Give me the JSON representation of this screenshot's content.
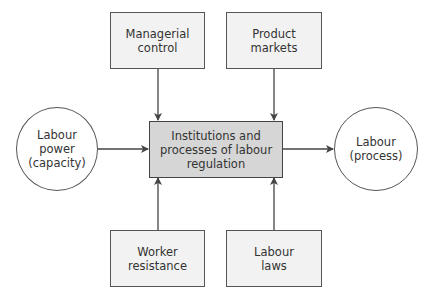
{
  "diagram": {
    "nodes": {
      "managerial_control": {
        "label": "Managerial\ncontrol",
        "shape": "box"
      },
      "product_markets": {
        "label": "Product\nmarkets",
        "shape": "box"
      },
      "central": {
        "label": "Institutions and\nprocesses of labour\nregulation",
        "shape": "box"
      },
      "labour_power": {
        "label": "Labour\npower\n(capacity)",
        "shape": "circle"
      },
      "labour_process": {
        "label": "Labour\n(process)",
        "shape": "circle"
      },
      "worker_resistance": {
        "label": "Worker\nresistance",
        "shape": "box"
      },
      "labour_laws": {
        "label": "Labour\nlaws",
        "shape": "box"
      }
    },
    "edges": [
      {
        "from": "managerial_control",
        "to": "central"
      },
      {
        "from": "product_markets",
        "to": "central"
      },
      {
        "from": "worker_resistance",
        "to": "central"
      },
      {
        "from": "labour_laws",
        "to": "central"
      },
      {
        "from": "labour_power",
        "to": "central"
      },
      {
        "from": "central",
        "to": "labour_process"
      }
    ],
    "colors": {
      "box_fill": "#f2f2f2",
      "central_fill": "#d6d6d6",
      "stroke": "#555555",
      "arrow": "#444444"
    }
  }
}
